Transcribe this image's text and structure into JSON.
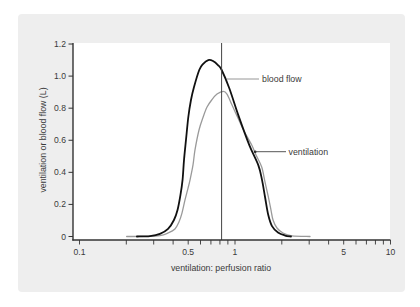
{
  "figure": {
    "panel_color": "#eeeeee",
    "plot_color": "#ffffff",
    "axis_color": "#333333"
  },
  "chart_data": {
    "type": "line",
    "title": "",
    "xlabel": "ventilation: perfusion ratio",
    "ylabel": "ventilation or blood flow (L)",
    "xscale": "log",
    "xlim": [
      0.1,
      10
    ],
    "ylim": [
      0,
      1.2
    ],
    "xticks": [
      0.1,
      0.5,
      1,
      5,
      10
    ],
    "xtick_labels": [
      "0.1",
      "0.5",
      "1",
      "5",
      "10"
    ],
    "xminor_ticks": [
      0.1,
      0.2,
      0.3,
      0.4,
      0.5,
      0.6,
      0.7,
      0.8,
      0.9,
      1,
      2,
      3,
      4,
      5,
      6,
      7,
      8,
      9,
      10
    ],
    "yticks": [
      0,
      0.2,
      0.4,
      0.6,
      0.8,
      1.0,
      1.2
    ],
    "ytick_labels": [
      "0",
      "0.2",
      "0.4",
      "0.6",
      "0.8",
      "1.0",
      "1.2"
    ],
    "grid": false,
    "legend": "inline annotations with leader lines",
    "reference_line": {
      "axis": "x",
      "value": 0.82,
      "color": "#444444"
    },
    "series": [
      {
        "name": "blood flow",
        "color": "#111111",
        "width": 1.8,
        "points": [
          [
            0.234,
            0
          ],
          [
            0.284,
            0.003
          ],
          [
            0.329,
            0.016
          ],
          [
            0.371,
            0.047
          ],
          [
            0.405,
            0.103
          ],
          [
            0.427,
            0.165
          ],
          [
            0.446,
            0.259
          ],
          [
            0.46,
            0.353
          ],
          [
            0.47,
            0.477
          ],
          [
            0.484,
            0.602
          ],
          [
            0.501,
            0.745
          ],
          [
            0.521,
            0.851
          ],
          [
            0.545,
            0.932
          ],
          [
            0.589,
            1.038
          ],
          [
            0.622,
            1.075
          ],
          [
            0.673,
            1.1
          ],
          [
            0.722,
            1.094
          ],
          [
            0.777,
            1.069
          ],
          [
            0.821,
            1.038
          ],
          [
            0.919,
            0.924
          ],
          [
            1.05,
            0.757
          ],
          [
            1.236,
            0.57
          ],
          [
            1.412,
            0.445
          ],
          [
            1.492,
            0.353
          ],
          [
            1.559,
            0.248
          ],
          [
            1.637,
            0.134
          ],
          [
            1.73,
            0.065
          ],
          [
            1.89,
            0.025
          ],
          [
            2.097,
            0.006
          ],
          [
            2.291,
            0
          ]
        ]
      },
      {
        "name": "ventilation",
        "color": "#9a9a9a",
        "width": 1.3,
        "points": [
          [
            0.201,
            0
          ],
          [
            0.264,
            0.001
          ],
          [
            0.329,
            0.006
          ],
          [
            0.371,
            0.022
          ],
          [
            0.411,
            0.047
          ],
          [
            0.436,
            0.09
          ],
          [
            0.456,
            0.146
          ],
          [
            0.477,
            0.228
          ],
          [
            0.499,
            0.302
          ],
          [
            0.514,
            0.353
          ],
          [
            0.537,
            0.446
          ],
          [
            0.553,
            0.54
          ],
          [
            0.587,
            0.664
          ],
          [
            0.625,
            0.747
          ],
          [
            0.661,
            0.807
          ],
          [
            0.708,
            0.851
          ],
          [
            0.766,
            0.888
          ],
          [
            0.841,
            0.905
          ],
          [
            0.888,
            0.888
          ],
          [
            0.957,
            0.82
          ],
          [
            1.045,
            0.739
          ],
          [
            1.143,
            0.658
          ],
          [
            1.281,
            0.57
          ],
          [
            1.365,
            0.508
          ],
          [
            1.485,
            0.433
          ],
          [
            1.559,
            0.34
          ],
          [
            1.637,
            0.248
          ],
          [
            1.704,
            0.165
          ],
          [
            1.756,
            0.103
          ],
          [
            1.862,
            0.053
          ],
          [
            2.036,
            0.022
          ],
          [
            2.326,
            0.004
          ],
          [
            3.036,
            0
          ]
        ]
      }
    ],
    "annotations": [
      {
        "text": "blood flow"
      },
      {
        "text": "ventilation"
      }
    ]
  }
}
